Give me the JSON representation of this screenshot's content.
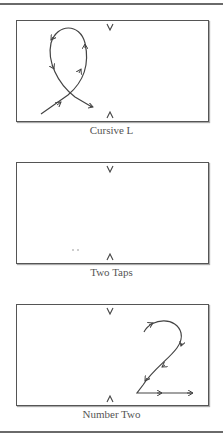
{
  "figures": [
    {
      "caption": "Cursive L",
      "gesture": "cursive-l"
    },
    {
      "caption": "Two Taps",
      "gesture": "two-taps"
    },
    {
      "caption": "Number Two",
      "gesture": "number-two"
    }
  ],
  "markers": {
    "top": "V",
    "bottom": "^"
  },
  "colors": {
    "stroke": "#444444",
    "border": "#555555",
    "text": "#555555"
  }
}
